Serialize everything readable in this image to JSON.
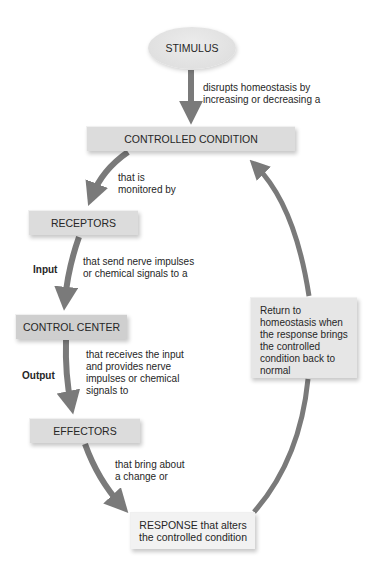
{
  "diagram": {
    "colors": {
      "arrow": "#7a7a7a",
      "box": "#dcdcdc",
      "box_dark": "#cfcfcf",
      "box_light": "#f2f2f2",
      "ellipse": "#e2e2e2",
      "text": "#262626"
    },
    "nodes": {
      "stimulus": "STIMULUS",
      "controlled_condition": "CONTROLLED CONDITION",
      "receptors": "RECEPTORS",
      "control_center": "CONTROL CENTER",
      "effectors": "EFFECTORS",
      "response": "RESPONSE that alters\nthe controlled condition",
      "return": "Return to\nhomeostasis when\nthe response brings\nthe controlled\ncondition back to\nnormal"
    },
    "edge_labels": {
      "stimulus_to_condition": "disrupts homeostasis by\nincreasing or decreasing a",
      "condition_to_receptors": "that is\nmonitored by",
      "receptors_to_control": "that send nerve impulses\nor chemical signals to a",
      "control_to_effectors": "that receives the input\nand provides nerve\nimpulses or chemical\nsignals to",
      "effectors_to_response": "that bring about\na change or"
    },
    "side_labels": {
      "input": "Input",
      "output": "Output"
    }
  }
}
